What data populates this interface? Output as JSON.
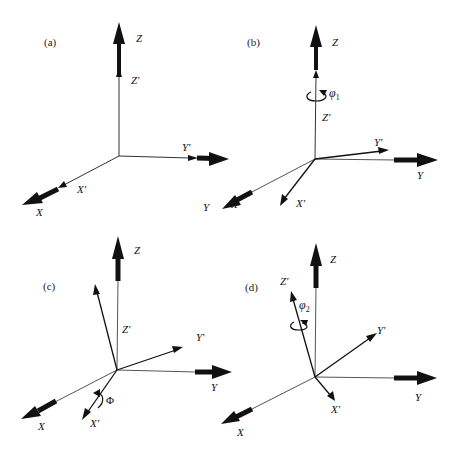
{
  "figure": {
    "panels": [
      {
        "id": "a",
        "label": "(a)",
        "fixed_axes": {
          "x": "X",
          "y": "Y",
          "z": "Z"
        },
        "rotated_axes": {
          "x": "X'",
          "y": "Y'",
          "z": "Z'"
        },
        "rotation": null,
        "note": "Rotated frame coincides with fixed frame"
      },
      {
        "id": "b",
        "label": "(b)",
        "fixed_axes": {
          "x": "X",
          "y": "Y",
          "z": "Z"
        },
        "rotated_axes": {
          "x": "X'",
          "y": "Y'",
          "z": "Z'"
        },
        "rotation": {
          "symbol": "φ",
          "subscript": "1",
          "about": "Z'"
        }
      },
      {
        "id": "c",
        "label": "(c)",
        "fixed_axes": {
          "x": "X",
          "y": "Y",
          "z": "Z"
        },
        "rotated_axes": {
          "x": "X'",
          "y": "Y'",
          "z": "Z'"
        },
        "rotation": {
          "symbol": "Φ",
          "subscript": "",
          "about": "X'"
        }
      },
      {
        "id": "d",
        "label": "(d)",
        "fixed_axes": {
          "x": "X",
          "y": "Y",
          "z": "Z"
        },
        "rotated_axes": {
          "x": "X'",
          "y": "Y'",
          "z": "Z'"
        },
        "rotation": {
          "symbol": "φ",
          "subscript": "2",
          "about": "Z'"
        }
      }
    ]
  },
  "colors": {
    "axis": "#111111",
    "thin_axis": "#555555",
    "background": "#ffffff"
  }
}
